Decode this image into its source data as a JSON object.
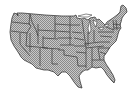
{
  "map": {
    "title": "United States (contiguous) state map",
    "region": "Contiguous United States",
    "fill_color": "#a8a8a8",
    "pattern_light": "#d0d0d0",
    "pattern_dark": "#808080",
    "border_color": "#3a3a3a",
    "background": "#ffffff",
    "style": "dithered gray fill with state boundaries"
  }
}
